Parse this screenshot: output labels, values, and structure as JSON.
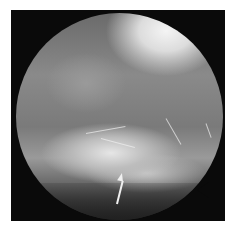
{
  "image": {
    "description": "Grayscale arthroscopic view in a circular field of view on black background",
    "annotations": [
      {
        "type": "arrow",
        "color": "#f0f0f0",
        "direction": "up-right",
        "position": "bottom-center"
      }
    ],
    "markers": [
      {
        "type": "notch",
        "position": "right-edge"
      }
    ]
  }
}
